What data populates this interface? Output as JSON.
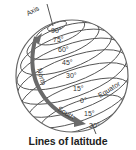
{
  "diagram": {
    "title": "Lines of latitude",
    "axis_label": "Axis",
    "equator_label": "Equator",
    "north_label": "North",
    "south_label": "South",
    "latitudes": [
      {
        "label": "90°"
      },
      {
        "label": "75°"
      },
      {
        "label": "60°"
      },
      {
        "label": "45°"
      },
      {
        "label": "30°"
      },
      {
        "label": "15°"
      },
      {
        "label": "0°"
      },
      {
        "label": "15°"
      },
      {
        "label": "30°"
      }
    ],
    "colors": {
      "line": "#555555",
      "arrow": "#666666",
      "text": "#333333"
    }
  }
}
